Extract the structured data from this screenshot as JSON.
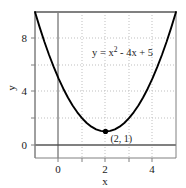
{
  "chart_data": {
    "type": "line",
    "title": "",
    "subtitle": "",
    "xlabel": "x",
    "ylabel": "y",
    "xlim": [
      -1,
      5
    ],
    "ylim": [
      -1,
      10
    ],
    "grid": true,
    "legend_position": "none",
    "equation_text": "y = x",
    "equation_exponent": "2",
    "equation_rest": " - 4x + 5",
    "equation_full": "y = x² - 4x + 5",
    "annotations": [
      {
        "name": "vertex",
        "label": "(2, 1)",
        "x": 2,
        "y": 1,
        "marker": "filled-circle"
      }
    ],
    "x_ticks": [
      -1,
      0,
      1,
      2,
      3,
      4,
      5
    ],
    "x_tick_labels": [
      "",
      "0",
      "",
      "2",
      "",
      "4",
      ""
    ],
    "y_ticks": [
      0,
      2,
      4,
      6,
      8,
      10
    ],
    "y_tick_labels": [
      "0",
      "",
      "4",
      "",
      "8",
      ""
    ],
    "series": [
      {
        "name": "y = x² - 4x + 5",
        "color": "#000000",
        "x": [
          -1,
          -0.8,
          -0.6,
          -0.4,
          -0.2,
          0,
          0.2,
          0.4,
          0.6,
          0.8,
          1,
          1.2,
          1.4,
          1.6,
          1.8,
          2,
          2.2,
          2.4,
          2.6,
          2.8,
          3,
          3.2,
          3.4,
          3.6,
          3.8,
          4,
          4.2,
          4.4,
          4.6,
          4.8,
          5
        ],
        "y": [
          10,
          8.84,
          7.76,
          6.76,
          5.84,
          5,
          4.24,
          3.56,
          2.96,
          2.44,
          2,
          1.64,
          1.36,
          1.16,
          1.04,
          1,
          1.04,
          1.16,
          1.36,
          1.64,
          2,
          2.44,
          2.96,
          3.56,
          4.24,
          5,
          5.84,
          6.76,
          7.76,
          8.84,
          10
        ]
      }
    ],
    "colors": {
      "curve": "#000000",
      "axis_line": "#808080",
      "frame": "#808080",
      "grid": "#bfbfbf",
      "zero_vertical": "#4d4d4d",
      "text": "#1a1a1a"
    }
  }
}
